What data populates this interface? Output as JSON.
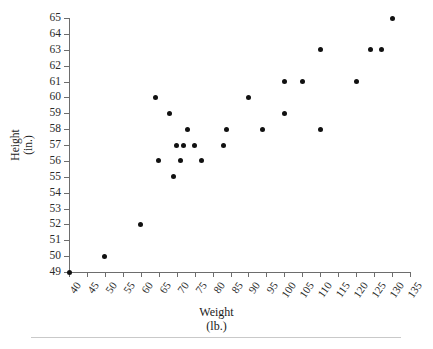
{
  "chart_data": {
    "type": "scatter",
    "title": "",
    "xlabel": "Weight (lb.)",
    "xlabel_line1": "Weight",
    "xlabel_line2": "(lb.)",
    "ylabel": "Height (in.)",
    "ylabel_line1": "Height",
    "ylabel_line2": "(in.)",
    "xlim": [
      40,
      135
    ],
    "ylim": [
      49,
      65
    ],
    "xticks": [
      40,
      45,
      50,
      55,
      60,
      65,
      70,
      75,
      80,
      85,
      90,
      95,
      100,
      105,
      110,
      115,
      120,
      125,
      130,
      135
    ],
    "yticks": [
      49,
      50,
      51,
      52,
      53,
      54,
      55,
      56,
      57,
      58,
      59,
      60,
      61,
      62,
      63,
      64,
      65
    ],
    "xtick_labels": [
      "40",
      "45",
      "50",
      "55",
      "60",
      "65",
      "70",
      "75",
      "80",
      "85",
      "90",
      "95",
      "100",
      "105",
      "110",
      "115",
      "120",
      "125",
      "130",
      "135"
    ],
    "ytick_labels": [
      "49",
      "50",
      "51",
      "52",
      "53",
      "54",
      "55",
      "56",
      "57",
      "58",
      "59",
      "60",
      "61",
      "62",
      "63",
      "64",
      "65"
    ],
    "grid": false,
    "legend": false,
    "marker": "filled-circle",
    "marker_color": "#111111",
    "axis_color": "#6d6d6d",
    "background_color": "#ffffff",
    "points": [
      {
        "x": 40,
        "y": 49
      },
      {
        "x": 50,
        "y": 50
      },
      {
        "x": 60,
        "y": 52
      },
      {
        "x": 64,
        "y": 60
      },
      {
        "x": 65,
        "y": 56
      },
      {
        "x": 68,
        "y": 59
      },
      {
        "x": 69,
        "y": 55
      },
      {
        "x": 70,
        "y": 57
      },
      {
        "x": 71,
        "y": 56
      },
      {
        "x": 72,
        "y": 57
      },
      {
        "x": 73,
        "y": 58
      },
      {
        "x": 75,
        "y": 57
      },
      {
        "x": 77,
        "y": 56
      },
      {
        "x": 83,
        "y": 57
      },
      {
        "x": 84,
        "y": 58
      },
      {
        "x": 90,
        "y": 60
      },
      {
        "x": 94,
        "y": 58
      },
      {
        "x": 100,
        "y": 59
      },
      {
        "x": 100,
        "y": 61
      },
      {
        "x": 105,
        "y": 61
      },
      {
        "x": 110,
        "y": 58
      },
      {
        "x": 110,
        "y": 63
      },
      {
        "x": 120,
        "y": 61
      },
      {
        "x": 124,
        "y": 63
      },
      {
        "x": 127,
        "y": 63
      },
      {
        "x": 130,
        "y": 65
      }
    ]
  }
}
